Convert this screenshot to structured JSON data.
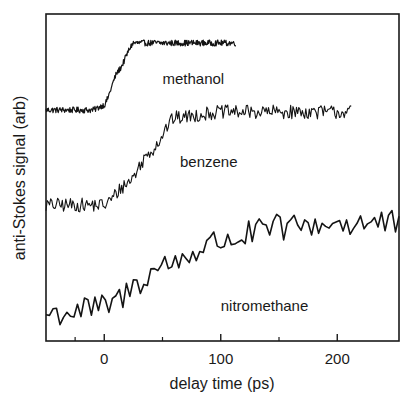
{
  "chart_data": {
    "type": "line",
    "title": "",
    "xlabel": "delay time (ps)",
    "ylabel": "anti-Stokes signal (arb)",
    "xlim": [
      -50,
      253
    ],
    "ylim": [
      0,
      327
    ],
    "x_ticks": [
      0,
      100,
      200
    ],
    "x_tick_labels": [
      "0",
      "100",
      "200"
    ],
    "x_minor_ticks": [
      -25,
      50,
      150
    ],
    "y_ticks": [],
    "grid": false,
    "legend": "none (inline curve labels)",
    "series": [
      {
        "name": "methanol",
        "label_position": {
          "x": 50,
          "y": 70
        },
        "x_range": [
          -50,
          113
        ],
        "step": 0.5,
        "noise_amplitude": 3,
        "linewidth": 1.2,
        "anchors": [
          {
            "x": -50,
            "y": 231
          },
          {
            "x": -10,
            "y": 231
          },
          {
            "x": 0,
            "y": 236
          },
          {
            "x": 12,
            "y": 270
          },
          {
            "x": 25,
            "y": 298
          },
          {
            "x": 113,
            "y": 298
          }
        ]
      },
      {
        "name": "benzene",
        "label_position": {
          "x": 65,
          "y": 153
        },
        "x_range": [
          -50,
          212
        ],
        "step": 1,
        "noise_amplitude": 7,
        "linewidth": 1.1,
        "anchors": [
          {
            "x": -50,
            "y": 136
          },
          {
            "x": 0,
            "y": 136
          },
          {
            "x": 20,
            "y": 158
          },
          {
            "x": 40,
            "y": 190
          },
          {
            "x": 60,
            "y": 223
          },
          {
            "x": 100,
            "y": 229
          },
          {
            "x": 212,
            "y": 229
          }
        ]
      },
      {
        "name": "nitromethane",
        "label_position": {
          "x": 100,
          "y": 297
        },
        "x_range": [
          -50,
          253
        ],
        "step": 3,
        "noise_amplitude": 14,
        "linewidth": 1.6,
        "anchors": [
          {
            "x": -50,
            "y": 27
          },
          {
            "x": 0,
            "y": 33
          },
          {
            "x": 50,
            "y": 75
          },
          {
            "x": 100,
            "y": 100
          },
          {
            "x": 150,
            "y": 113
          },
          {
            "x": 200,
            "y": 118
          },
          {
            "x": 253,
            "y": 117
          }
        ]
      }
    ]
  },
  "plot_area": {
    "left": 46,
    "top": 14,
    "right": 399,
    "bottom": 341
  },
  "colors": {
    "line": "#141414",
    "frame": "#1a1a1a",
    "background": "#ffffff"
  }
}
